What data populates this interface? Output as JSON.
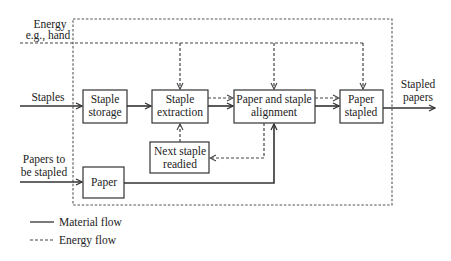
{
  "diagram": {
    "inputs": {
      "energy": {
        "line1": "Energy",
        "line2": "e.g., hand"
      },
      "staples": "Staples",
      "papers": {
        "line1": "Papers to",
        "line2": "be stapled"
      }
    },
    "output": {
      "line1": "Stapled",
      "line2": "papers"
    },
    "blocks": [
      {
        "id": "staple-storage",
        "line1": "Staple",
        "line2": "storage"
      },
      {
        "id": "staple-extraction",
        "line1": "Staple",
        "line2": "extraction"
      },
      {
        "id": "paper-and-staple-alignment",
        "line1": "Paper and staple",
        "line2": "alignment"
      },
      {
        "id": "paper-stapled",
        "line1": "Paper",
        "line2": "stapled"
      },
      {
        "id": "next-staple-readied",
        "line1": "Next staple",
        "line2": "readied"
      },
      {
        "id": "paper",
        "line1": "Paper"
      }
    ],
    "flows": [
      {
        "from": "Staples",
        "to": "staple-storage",
        "type": "material"
      },
      {
        "from": "staple-storage",
        "to": "staple-extraction",
        "type": "material"
      },
      {
        "from": "staple-extraction",
        "to": "paper-and-staple-alignment",
        "type": "material"
      },
      {
        "from": "staple-extraction",
        "to": "paper-and-staple-alignment",
        "type": "energy"
      },
      {
        "from": "paper-and-staple-alignment",
        "to": "paper-stapled",
        "type": "material"
      },
      {
        "from": "paper-and-staple-alignment",
        "to": "paper-stapled",
        "type": "energy"
      },
      {
        "from": "paper-stapled",
        "to": "Stapled papers",
        "type": "material"
      },
      {
        "from": "Papers to be stapled",
        "to": "paper",
        "type": "material"
      },
      {
        "from": "paper",
        "to": "paper-and-staple-alignment",
        "type": "material"
      },
      {
        "from": "paper-and-staple-alignment",
        "to": "next-staple-readied",
        "type": "energy"
      },
      {
        "from": "next-staple-readied",
        "to": "staple-extraction",
        "type": "energy"
      },
      {
        "from": "Energy e.g., hand",
        "to": "staple-extraction",
        "type": "energy"
      },
      {
        "from": "Energy e.g., hand",
        "to": "paper-and-staple-alignment",
        "type": "energy"
      },
      {
        "from": "Energy e.g., hand",
        "to": "paper-stapled",
        "type": "energy"
      }
    ],
    "legend": {
      "material": "Material flow",
      "energy": "Energy flow"
    }
  }
}
